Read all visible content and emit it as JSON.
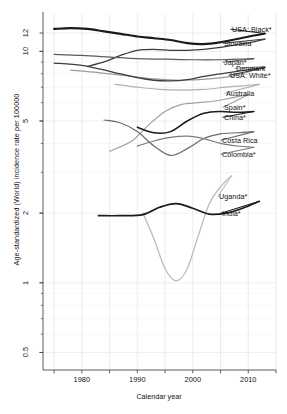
{
  "chart_data": {
    "type": "line",
    "title": "",
    "xlabel": "Calendar year",
    "ylabel": "Age-standardized (World) incidence rate per 100000",
    "xlim": [
      1973,
      2015
    ],
    "ylim": [
      0.42,
      14.5
    ],
    "yscale": "log",
    "grid": true,
    "legend_position": "right-inline-labels",
    "xticks": [
      1980,
      1990,
      2000,
      2010
    ],
    "xticklabels": [
      "1980",
      "1990",
      "2000",
      "2010"
    ],
    "yticks": [
      0.5,
      1,
      2,
      5,
      10,
      12
    ],
    "yticklabels": [
      "0.5",
      "1",
      "2",
      "5",
      "10",
      "12"
    ],
    "series": [
      {
        "name": "USA: Black*",
        "label": "USA: Black*",
        "color": "#1a1a1a",
        "width": 2.1,
        "x": [
          1975,
          1978,
          1981,
          1984,
          1987,
          1990,
          1993,
          1996,
          1999,
          2002,
          2005,
          2008,
          2011,
          2013
        ],
        "values": [
          12.5,
          12.6,
          12.5,
          12.2,
          11.9,
          11.6,
          11.4,
          11.2,
          10.85,
          10.75,
          10.95,
          11.3,
          11.7,
          11.95
        ]
      },
      {
        "name": "Slovakia",
        "label": "Slovakia",
        "color": "#3c3c3c",
        "width": 1.3,
        "x": [
          1981,
          1984,
          1987,
          1990,
          1993,
          1996,
          1999,
          2002,
          2005,
          2008,
          2011,
          2013
        ],
        "values": [
          8.6,
          9.0,
          9.6,
          10.1,
          10.2,
          10.1,
          10.1,
          10.2,
          10.4,
          10.7,
          11.0,
          11.3
        ]
      },
      {
        "name": "Japan*",
        "label": "Japan*",
        "color": "#5a5a5a",
        "width": 1.2,
        "x": [
          1975,
          1980,
          1985,
          1990,
          1995,
          2000,
          2005,
          2008,
          2011
        ],
        "values": [
          9.7,
          9.6,
          9.45,
          9.3,
          9.25,
          9.2,
          9.2,
          9.25,
          9.3
        ]
      },
      {
        "name": "Denmark",
        "label": "Denmark",
        "color": "#9a9a9a",
        "width": 1.2,
        "x": [
          1978,
          1983,
          1988,
          1993,
          1998,
          2003,
          2008,
          2011,
          2013
        ],
        "values": [
          8.3,
          8.1,
          7.85,
          7.6,
          7.5,
          7.6,
          7.9,
          8.3,
          8.6
        ]
      },
      {
        "name": "USA: White*",
        "label": "USA: White*",
        "color": "#3c3c3c",
        "width": 1.3,
        "x": [
          1975,
          1980,
          1985,
          1990,
          1993,
          1996,
          1999,
          2002,
          2005,
          2008,
          2011,
          2013
        ],
        "values": [
          8.9,
          8.7,
          8.2,
          7.7,
          7.5,
          7.45,
          7.55,
          7.8,
          8.0,
          8.2,
          8.4,
          8.5
        ]
      },
      {
        "name": "Australia",
        "label": "Australia",
        "color": "#b0b0b0",
        "width": 1.2,
        "x": [
          1986,
          1990,
          1994,
          1998,
          2002,
          2006,
          2009,
          2012
        ],
        "values": [
          7.2,
          7.0,
          6.85,
          6.8,
          6.85,
          7.0,
          7.1,
          7.2
        ]
      },
      {
        "name": "Spain*",
        "label": "Spain*",
        "color": "#a0a0a0",
        "width": 1.2,
        "x": [
          1985,
          1989,
          1992,
          1995,
          1998,
          2001,
          2004,
          2007,
          2010
        ],
        "values": [
          3.7,
          4.1,
          4.8,
          5.5,
          5.9,
          6.0,
          6.1,
          6.3,
          6.5
        ]
      },
      {
        "name": "China*",
        "label": "China*",
        "color": "#1a1a1a",
        "width": 1.5,
        "x": [
          1990,
          1993,
          1996,
          1999,
          2002,
          2005,
          2008,
          2011
        ],
        "values": [
          4.7,
          4.45,
          4.5,
          5.0,
          5.4,
          5.5,
          5.45,
          5.5
        ]
      },
      {
        "name": "Costa Rica",
        "label": "Costa Rica",
        "color": "#6a6a6a",
        "width": 1.2,
        "x": [
          1984,
          1987,
          1990,
          1993,
          1996,
          1999,
          2002,
          2005,
          2008,
          2011
        ],
        "values": [
          5.05,
          4.9,
          4.5,
          3.9,
          3.55,
          3.8,
          4.2,
          4.4,
          4.45,
          4.5
        ]
      },
      {
        "name": "Colombia*",
        "label": "Colombia*",
        "color": "#7a7a7a",
        "width": 1.2,
        "x": [
          1990,
          1993,
          1996,
          1999,
          2002,
          2005,
          2008,
          2011
        ],
        "values": [
          3.9,
          4.1,
          4.25,
          4.3,
          4.2,
          4.0,
          3.9,
          3.85
        ]
      },
      {
        "name": "Uganda*",
        "label": "Uganda*",
        "color": "#bdbdbd",
        "width": 1.3,
        "x": [
          1991,
          1993,
          1995,
          1997,
          1999,
          2001,
          2003,
          2005,
          2007
        ],
        "values": [
          2.0,
          1.55,
          1.15,
          1.02,
          1.15,
          1.6,
          2.2,
          2.6,
          2.9
        ]
      },
      {
        "name": "India*",
        "label": "India*",
        "color": "#1a1a1a",
        "width": 1.7,
        "x": [
          1983,
          1987,
          1991,
          1994,
          1997,
          2000,
          2003,
          2006,
          2009,
          2012
        ],
        "values": [
          1.95,
          1.95,
          1.97,
          2.12,
          2.2,
          2.1,
          1.98,
          2.0,
          2.1,
          2.25
        ]
      }
    ],
    "annotations": [
      {
        "text": "USA: Black*",
        "x": 232,
        "y": 25
      },
      {
        "text": "Slovakia",
        "x": 224,
        "y": 39
      },
      {
        "text": "Japan*",
        "x": 224,
        "y": 58
      },
      {
        "text": "Denmark",
        "x": 236,
        "y": 64
      },
      {
        "text": "USA: White*",
        "x": 230,
        "y": 71
      },
      {
        "text": "Australia",
        "x": 226,
        "y": 89
      },
      {
        "text": "Spain*",
        "x": 224,
        "y": 103
      },
      {
        "text": "China*",
        "x": 224,
        "y": 113
      },
      {
        "text": "Costa Rica",
        "x": 222,
        "y": 136
      },
      {
        "text": "Colombia*",
        "x": 222,
        "y": 150
      },
      {
        "text": "Uganda*",
        "x": 219,
        "y": 192
      },
      {
        "text": "India*",
        "x": 222,
        "y": 209
      }
    ]
  }
}
